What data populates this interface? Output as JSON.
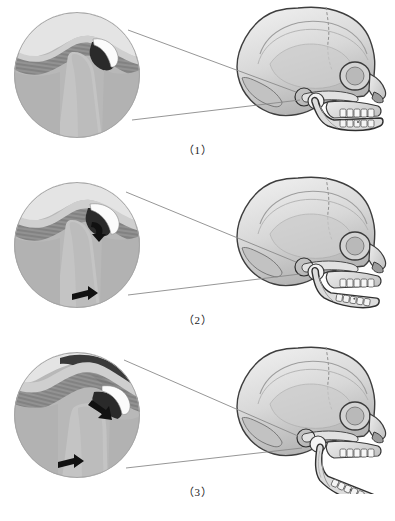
{
  "figure": {
    "background_color": "#ffffff",
    "panel_count": 3
  },
  "palette": {
    "bone_light": "#e9e9e9",
    "bone_mid": "#c9c9c9",
    "bone_shadow": "#9a9a9a",
    "tissue_gray": "#b5b5b5",
    "tissue_dark": "#6e6e6e",
    "joint_space_black": "#262626",
    "disc_white": "#fbfbfb",
    "arrow_black": "#111111",
    "outline": "#3a3a3a",
    "leader_line": "#8a8a8a"
  },
  "panels": [
    {
      "id": "panel-1",
      "caption": "（1）",
      "caption_number": "1",
      "stage_name": "closed-mouth-rest-position",
      "inset": {
        "name": "tmj-detail-closed",
        "shape": "circle",
        "structures": [
          "mandibular-fossa",
          "articular-disc",
          "condyle",
          "joint-space"
        ],
        "arrows": []
      },
      "skull": {
        "name": "lateral-skull-closed",
        "view": "lateral",
        "mandible_position": "closed",
        "jaw_open_degrees": 0,
        "tmj_marker": true
      },
      "leader_lines": 2
    },
    {
      "id": "panel-2",
      "caption": "（2）",
      "caption_number": "2",
      "stage_name": "rotation-phase-partial-opening",
      "inset": {
        "name": "tmj-detail-rotation",
        "shape": "circle",
        "structures": [
          "mandibular-fossa",
          "articular-disc",
          "condyle",
          "joint-space"
        ],
        "arrows": [
          "condyle-rotation-arrow",
          "mandible-downward-arrow"
        ]
      },
      "skull": {
        "name": "lateral-skull-partially-open",
        "view": "lateral",
        "mandible_position": "partially-open",
        "jaw_open_degrees": 8,
        "tmj_marker": true
      },
      "leader_lines": 2
    },
    {
      "id": "panel-3",
      "caption": "（3）",
      "caption_number": "3",
      "stage_name": "translation-phase-wide-opening",
      "inset": {
        "name": "tmj-detail-translation",
        "shape": "circle",
        "structures": [
          "articular-eminence",
          "articular-disc",
          "condyle-translated",
          "joint-space"
        ],
        "arrows": [
          "condyle-translation-arrow",
          "mandible-downward-arrow"
        ]
      },
      "skull": {
        "name": "lateral-skull-wide-open",
        "view": "lateral",
        "mandible_position": "wide-open",
        "jaw_open_degrees": 22,
        "tmj_marker": true
      },
      "leader_lines": 2
    }
  ]
}
